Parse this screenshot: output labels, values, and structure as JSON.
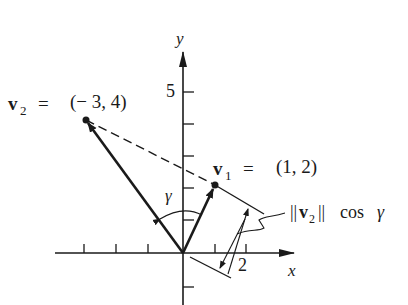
{
  "diagram": {
    "axes": {
      "x_label": "x",
      "y_label": "y",
      "x_tick_label": "2",
      "y_tick_label": "5"
    },
    "v2": {
      "name": "v",
      "subscript": "2",
      "equals": "=",
      "value": "(− 3,  4)",
      "coords": [
        -3,
        4
      ]
    },
    "v1": {
      "name": "v",
      "subscript": "1",
      "equals": "=",
      "value": "(1,  2)",
      "coords": [
        1,
        2
      ]
    },
    "angle_label": "γ",
    "projection_label": {
      "bars_left": "||",
      "name": "v",
      "subscript": "2",
      "bars_right": "||",
      "func": "cos",
      "angle": "γ"
    },
    "colors": {
      "ink": "#1a1a1a",
      "background": "#ffffff"
    }
  }
}
